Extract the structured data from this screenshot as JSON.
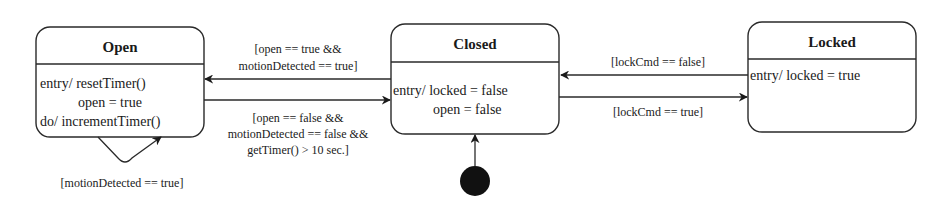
{
  "diagram": {
    "type": "uml-state-machine",
    "states": [
      {
        "id": "open",
        "name": "Open",
        "actions": [
          "entry/ resetTimer()",
          "open = true",
          "do/ incrementTimer()"
        ]
      },
      {
        "id": "closed",
        "name": "Closed",
        "actions": [
          "entry/ locked = false",
          "open = false"
        ]
      },
      {
        "id": "locked",
        "name": "Locked",
        "actions": [
          "entry/ locked = true"
        ]
      }
    ],
    "initial_state": "closed",
    "transitions": [
      {
        "from": "closed",
        "to": "open",
        "guard": [
          "[open == true &&",
          "motionDetected == true]"
        ]
      },
      {
        "from": "open",
        "to": "closed",
        "guard": [
          "[open == false &&",
          "motionDetected == false &&",
          "getTimer() > 10 sec.]"
        ]
      },
      {
        "from": "locked",
        "to": "closed",
        "guard": [
          "[lockCmd == false]"
        ]
      },
      {
        "from": "closed",
        "to": "locked",
        "guard": [
          "[lockCmd == true]"
        ]
      },
      {
        "from": "open",
        "to": "open",
        "guard": [
          "[motionDetected == true]"
        ]
      }
    ]
  }
}
